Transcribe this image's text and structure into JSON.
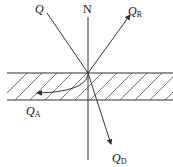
{
  "diagram": {
    "title": "",
    "labels": {
      "incident": {
        "main": "Q",
        "sub": ""
      },
      "normal": {
        "main": "N",
        "sub": ""
      },
      "reflected": {
        "main": "Q",
        "sub": "R"
      },
      "absorbed": {
        "main": "Q",
        "sub": "A"
      },
      "transmitted": {
        "main": "Q",
        "sub": "D"
      }
    },
    "medium": {
      "pattern": "hatched",
      "color": "#333333"
    },
    "stroke_color": "#333333"
  }
}
